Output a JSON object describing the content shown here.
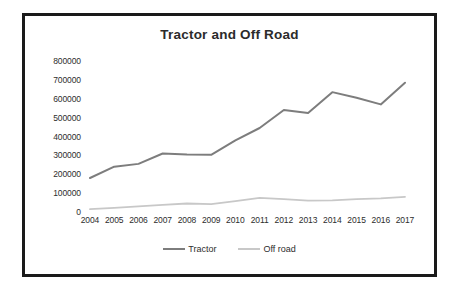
{
  "chart_data": {
    "type": "line",
    "title": "Tractor and Off Road",
    "xlabel": "",
    "ylabel": "",
    "categories": [
      "2004",
      "2005",
      "2006",
      "2007",
      "2008",
      "2009",
      "2010",
      "2011",
      "2012",
      "2013",
      "2014",
      "2015",
      "2016",
      "2017"
    ],
    "series": [
      {
        "name": "Tractor",
        "color": "#7d7d7d",
        "values": [
          180000,
          240000,
          255000,
          310000,
          305000,
          303000,
          380000,
          445000,
          540000,
          525000,
          635000,
          605000,
          570000,
          685000
        ]
      },
      {
        "name": "Off road",
        "color": "#c8c8c8",
        "values": [
          15000,
          22000,
          30000,
          38000,
          45000,
          42000,
          58000,
          75000,
          68000,
          60000,
          62000,
          68000,
          72000,
          80000
        ]
      }
    ],
    "ylim": [
      0,
      800000
    ],
    "ytick_labels": [
      "800000",
      "700000",
      "600000",
      "500000",
      "400000",
      "300000",
      "200000",
      "100000",
      "0"
    ],
    "ytick_values": [
      800000,
      700000,
      600000,
      500000,
      400000,
      300000,
      200000,
      100000,
      0
    ],
    "grid": false,
    "legend_position": "bottom"
  },
  "frame": {
    "border_color": "#1a1a1a",
    "background": "#ffffff"
  }
}
